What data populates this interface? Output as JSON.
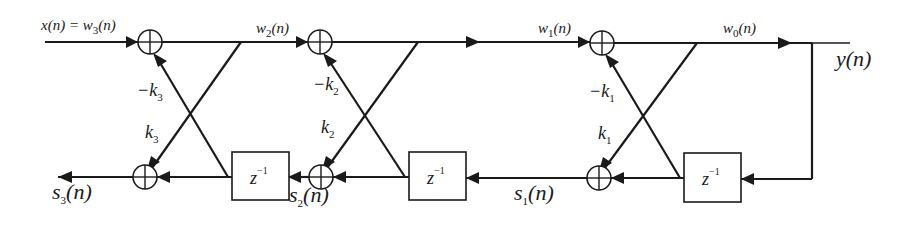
{
  "diagram": {
    "input_label": {
      "main": "x(n) = w",
      "sub": "3",
      "tail": "(n)"
    },
    "output_label": "y(n)",
    "stages": [
      {
        "id": 3,
        "forward_out_label": {
          "main": "w",
          "sub": "2",
          "tail": "(n)"
        },
        "minus_k_label": {
          "main": "−k",
          "sub": "3"
        },
        "k_label": {
          "main": "k",
          "sub": "3"
        },
        "backward_out_label": {
          "main": "s",
          "sub": "3",
          "tail": "(n)"
        }
      },
      {
        "id": 2,
        "forward_out_label": {
          "main": "w",
          "sub": "1",
          "tail": "(n)"
        },
        "minus_k_label": {
          "main": "−k",
          "sub": "2"
        },
        "k_label": {
          "main": "k",
          "sub": "2"
        },
        "backward_out_label": {
          "main": "s",
          "sub": "2",
          "tail": "(n)"
        }
      },
      {
        "id": 1,
        "forward_out_label": {
          "main": "w",
          "sub": "0",
          "tail": "(n)"
        },
        "minus_k_label": {
          "main": "−k",
          "sub": "1"
        },
        "k_label": {
          "main": "k",
          "sub": "1"
        },
        "backward_out_label": {
          "main": "s",
          "sub": "1",
          "tail": "(n)"
        }
      }
    ],
    "delay_label": {
      "main": "z",
      "sup": "−1"
    },
    "colors": {
      "line": "#1a1a1a",
      "background": "#ffffff"
    }
  }
}
